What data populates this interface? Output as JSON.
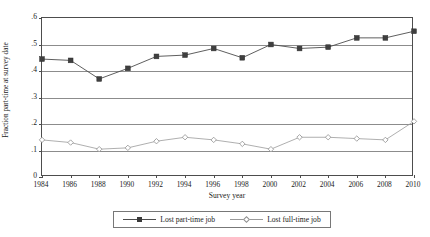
{
  "chart_data": {
    "type": "line",
    "title": "",
    "xlabel": "Survey year",
    "ylabel": "Fraction part-time at survey date",
    "x": [
      1984,
      1986,
      1988,
      1990,
      1992,
      1994,
      1996,
      1998,
      2000,
      2002,
      2004,
      2006,
      2008,
      2010
    ],
    "xtick_labels": [
      "1984",
      "1986",
      "1988",
      "1990",
      "1992",
      "1994",
      "1996",
      "1998",
      "2000",
      "2002",
      "2004",
      "2006",
      "2008",
      "2010"
    ],
    "ytick_values": [
      0,
      0.1,
      0.2,
      0.3,
      0.4,
      0.5,
      0.6
    ],
    "ytick_labels": [
      "0",
      ".1",
      ".2",
      ".3",
      ".4",
      ".5",
      ".6"
    ],
    "ylim": [
      0,
      0.6
    ],
    "xlim": [
      1984,
      2010
    ],
    "grid": "horizontal",
    "legend_position": "below-center",
    "series": [
      {
        "name": "Lost part-time job",
        "marker": "filled-square",
        "color": "#4d4d4d",
        "values": [
          0.445,
          0.44,
          0.37,
          0.41,
          0.455,
          0.46,
          0.485,
          0.45,
          0.5,
          0.485,
          0.49,
          0.525,
          0.525,
          0.55
        ]
      },
      {
        "name": "Lost full-time job",
        "marker": "open-diamond",
        "color": "#9a9a9a",
        "values": [
          0.14,
          0.13,
          0.105,
          0.11,
          0.135,
          0.15,
          0.14,
          0.125,
          0.105,
          0.15,
          0.15,
          0.145,
          0.14,
          0.21
        ]
      }
    ]
  },
  "legend": {
    "entries": [
      {
        "label": "Lost part-time job"
      },
      {
        "label": "Lost full-time job"
      }
    ]
  },
  "colors": {
    "series_part_time": "#4d4d4d",
    "series_full_time": "#9a9a9a",
    "gridline": "#8c8c8c",
    "frame": "#4d4d4d",
    "text": "#1a1a1a"
  }
}
